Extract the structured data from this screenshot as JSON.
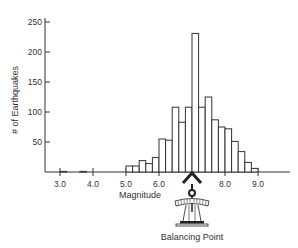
{
  "chart_data": {
    "type": "bar",
    "title": "",
    "xlabel": "Magnitude",
    "ylabel": "# of Earthquakes",
    "xlim": [
      2.8,
      9.6
    ],
    "ylim": [
      0,
      250
    ],
    "bin_width": 0.2,
    "x_ticks": [
      "3.0",
      "4.0",
      "5.0",
      "6.0",
      "8.0",
      "9.0"
    ],
    "y_ticks": [
      "50",
      "100",
      "150",
      "200",
      "250"
    ],
    "grid": false,
    "legend": null,
    "bins": [
      {
        "start": 3.0,
        "end": 3.2,
        "count": 1
      },
      {
        "start": 3.6,
        "end": 3.8,
        "count": 1
      },
      {
        "start": 5.0,
        "end": 5.2,
        "count": 10
      },
      {
        "start": 5.2,
        "end": 5.4,
        "count": 10
      },
      {
        "start": 5.4,
        "end": 5.6,
        "count": 19
      },
      {
        "start": 5.6,
        "end": 5.8,
        "count": 14
      },
      {
        "start": 5.8,
        "end": 6.0,
        "count": 24
      },
      {
        "start": 6.0,
        "end": 6.2,
        "count": 55
      },
      {
        "start": 6.2,
        "end": 6.4,
        "count": 53
      },
      {
        "start": 6.4,
        "end": 6.6,
        "count": 108
      },
      {
        "start": 6.6,
        "end": 6.8,
        "count": 83
      },
      {
        "start": 6.8,
        "end": 7.0,
        "count": 108
      },
      {
        "start": 7.0,
        "end": 7.2,
        "count": 231
      },
      {
        "start": 7.2,
        "end": 7.4,
        "count": 108
      },
      {
        "start": 7.4,
        "end": 7.6,
        "count": 125
      },
      {
        "start": 7.6,
        "end": 7.8,
        "count": 87
      },
      {
        "start": 7.8,
        "end": 8.0,
        "count": 75
      },
      {
        "start": 8.0,
        "end": 8.2,
        "count": 72
      },
      {
        "start": 8.2,
        "end": 8.4,
        "count": 51
      },
      {
        "start": 8.4,
        "end": 8.6,
        "count": 34
      },
      {
        "start": 8.6,
        "end": 8.8,
        "count": 16
      },
      {
        "start": 8.8,
        "end": 9.0,
        "count": 6
      }
    ],
    "annotations": [
      {
        "text": "Balancing Point",
        "x": 7.1,
        "description": "fulcrum/scale icon under the mean of the distribution"
      }
    ]
  },
  "labels": {
    "xlabel": "Magnitude",
    "ylabel": "# of Earthquakes",
    "balancing_point": "Balancing Point"
  },
  "colors": {
    "bar_fill": "#ffffff",
    "bar_stroke": "#333333",
    "axis": "#333333",
    "text": "#333333"
  }
}
